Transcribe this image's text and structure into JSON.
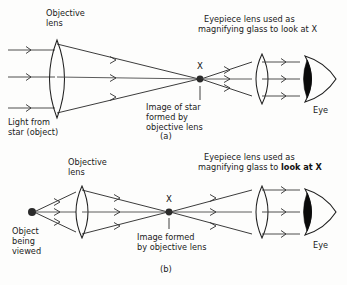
{
  "figure": {
    "background_color": "#fdfdfc",
    "ink_color": "#1f1f1f"
  },
  "panel_a": {
    "caption": "(a)",
    "objective_label_line1": "Objective",
    "objective_label_line2": "lens",
    "eyepiece_label_line1": "Eyepiece lens used as",
    "eyepiece_label_line2_normal": "magnifying glass to ",
    "eyepiece_label_line2_bold": "look at X",
    "image_point_label": "X",
    "image_caption_line1": "Image of star",
    "image_caption_line2": "formed by",
    "image_caption_line3": "objective lens",
    "source_label_line1": "Light from",
    "source_label_line2": "star (object)",
    "eye_label": "Eye",
    "incoming_rays": "parallel",
    "ray_count": 3
  },
  "panel_b": {
    "caption": "(b)",
    "objective_label_line1": "Objective",
    "objective_label_line2": "lens",
    "eyepiece_label_line1": "Eyepiece lens used as",
    "eyepiece_label_line2_normal": "magnifying glass to ",
    "eyepiece_label_line2_bold": "look at X",
    "image_point_label": "X",
    "image_caption_line1": "Image formed",
    "image_caption_line2": "by objective lens",
    "source_label_line1": "Object",
    "source_label_line2": "being",
    "source_label_line3": "viewed",
    "eye_label": "Eye",
    "incoming_rays": "diverging",
    "ray_count": 3
  }
}
